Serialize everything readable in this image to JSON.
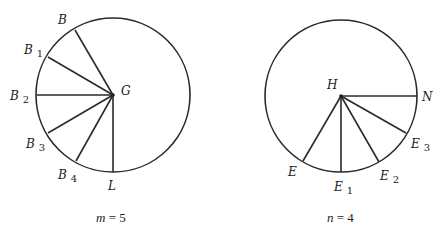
{
  "figures": [
    {
      "id": "left",
      "center": {
        "label": "G",
        "x": 113,
        "y": 95
      },
      "radius": 77,
      "caption": {
        "var": "m",
        "eq": " = 5",
        "x": 96,
        "y": 222
      },
      "spokes": [
        {
          "label": "B",
          "sub": "",
          "x": 75,
          "y": 30,
          "lx": 58,
          "ly": 24
        },
        {
          "label": "B",
          "sub": "1",
          "x": 48,
          "y": 57,
          "lx": 24,
          "ly": 54
        },
        {
          "label": "B",
          "sub": "2",
          "x": 37,
          "y": 95,
          "lx": 10,
          "ly": 100
        },
        {
          "label": "B",
          "sub": "3",
          "x": 48,
          "y": 133,
          "lx": 26,
          "ly": 148
        },
        {
          "label": "B",
          "sub": "4",
          "x": 76,
          "y": 161,
          "lx": 58,
          "ly": 179
        },
        {
          "label": "L",
          "sub": "",
          "x": 113,
          "y": 172,
          "lx": 108,
          "ly": 190
        }
      ],
      "center_label_pos": {
        "x": 121,
        "y": 95
      }
    },
    {
      "id": "right",
      "center": {
        "label": "H",
        "x": 341,
        "y": 96
      },
      "radius": 76,
      "caption": {
        "var": "n",
        "eq": " = 4",
        "x": 327,
        "y": 222
      },
      "spokes": [
        {
          "label": "N",
          "sub": "",
          "x": 417,
          "y": 96,
          "lx": 422,
          "ly": 101
        },
        {
          "label": "E",
          "sub": "3",
          "x": 406,
          "y": 133,
          "lx": 411,
          "ly": 148
        },
        {
          "label": "E",
          "sub": "2",
          "x": 379,
          "y": 162,
          "lx": 380,
          "ly": 180
        },
        {
          "label": "E",
          "sub": "1",
          "x": 341,
          "y": 172,
          "lx": 334,
          "ly": 191
        },
        {
          "label": "E",
          "sub": "",
          "x": 303,
          "y": 161,
          "lx": 288,
          "ly": 176
        }
      ],
      "center_label_pos": {
        "x": 327,
        "y": 89
      }
    }
  ]
}
